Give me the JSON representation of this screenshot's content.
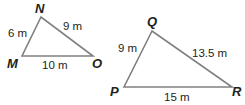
{
  "colors": {
    "stroke": "#808080",
    "text": "#231f20"
  },
  "triangles": [
    {
      "name": "MNO",
      "vertices": [
        {
          "label": "N",
          "x": 41,
          "y": 17
        },
        {
          "label": "M",
          "x": 22,
          "y": 56
        },
        {
          "label": "O",
          "x": 93,
          "y": 56
        }
      ],
      "sides": {
        "MN": "6 m",
        "NO": "9 m",
        "MO": "10 m"
      }
    },
    {
      "name": "PQR",
      "vertices": [
        {
          "label": "Q",
          "x": 152,
          "y": 31
        },
        {
          "label": "P",
          "x": 124,
          "y": 87
        },
        {
          "label": "R",
          "x": 232,
          "y": 87
        }
      ],
      "sides": {
        "PQ": "9 m",
        "QR": "13.5 m",
        "PR": "15 m"
      }
    }
  ]
}
